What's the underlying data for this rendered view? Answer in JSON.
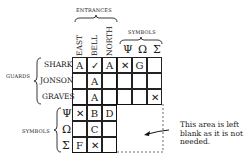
{
  "groups": {
    "entrances": "ENTRANCES",
    "symbols_top": "SYMBOLS",
    "guards": "GUARDS",
    "symbols_left": "SYMBOLS"
  },
  "columns": [
    "EAST",
    "BELL",
    "NORTH",
    "Ψ",
    "Ω",
    "Σ"
  ],
  "rows": [
    "SHARK",
    "JONSON",
    "GRAVES",
    "Ψ",
    "Ω",
    "Σ"
  ],
  "cells": [
    [
      "A",
      "✓",
      "A",
      "✕",
      "G",
      ""
    ],
    [
      "",
      "A",
      "",
      "",
      "",
      ""
    ],
    [
      "",
      "A",
      "",
      "",
      "",
      "✕"
    ],
    [
      "✕",
      "B",
      "D",
      null,
      null,
      null
    ],
    [
      "",
      "C",
      "",
      null,
      null,
      null
    ],
    [
      "F",
      "✕",
      "",
      null,
      null,
      null
    ]
  ],
  "note": [
    "This area is left",
    "blank as it is not",
    "needed."
  ]
}
